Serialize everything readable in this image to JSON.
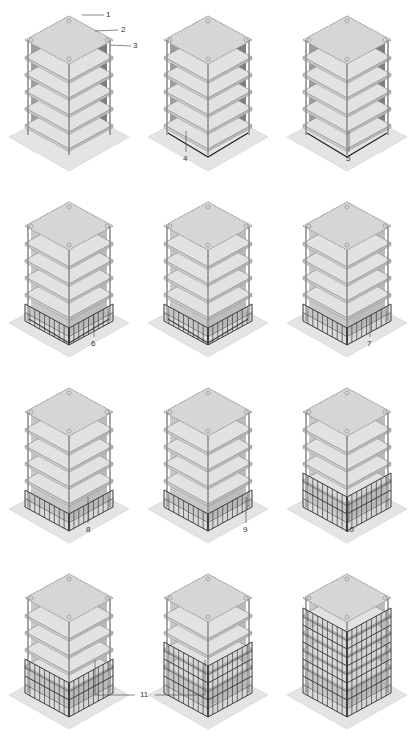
{
  "figure": {
    "grid": {
      "rows": 4,
      "cols": 3
    },
    "colors": {
      "slab": "#d6d6d6",
      "slab_edge": "#8a8a8a",
      "core": "#c8c8c8",
      "core_dark": "#9a9a9a",
      "ground": "#e4e4e4",
      "facade": "#3a3a3a",
      "label": "#333333"
    },
    "panels": [
      {
        "step": 1,
        "facade_rows": 0,
        "callouts": [
          "1",
          "2",
          "3"
        ],
        "shaded_walls": true
      },
      {
        "step": 2,
        "facade_rows": 0,
        "callouts": [
          "4"
        ],
        "shaded_walls": true
      },
      {
        "step": 3,
        "facade_rows": 0,
        "callouts": [
          "5"
        ],
        "shaded_walls": true
      },
      {
        "step": 4,
        "facade_rows": 1,
        "callouts": [
          "6"
        ],
        "partial": true
      },
      {
        "step": 5,
        "facade_rows": 1,
        "callouts": [],
        "partial": true
      },
      {
        "step": 6,
        "facade_rows": 1,
        "callouts": [
          "7"
        ]
      },
      {
        "step": 7,
        "facade_rows": 1,
        "callouts": [
          "8"
        ]
      },
      {
        "step": 8,
        "facade_rows": 1,
        "callouts": [
          "9"
        ]
      },
      {
        "step": 9,
        "facade_rows": 2,
        "callouts": [
          "10"
        ]
      },
      {
        "step": 10,
        "facade_rows": 2,
        "callouts": []
      },
      {
        "step": 11,
        "facade_rows": 3,
        "callouts": []
      },
      {
        "step": 12,
        "facade_rows": 5,
        "callouts": [],
        "complete": true
      }
    ],
    "labels": {
      "l1": "1",
      "l2": "2",
      "l3": "3",
      "l4": "4",
      "l5": "5",
      "l6": "6",
      "l7": "7",
      "l8": "8",
      "l9": "9",
      "l10": "10",
      "l11": "11"
    }
  }
}
